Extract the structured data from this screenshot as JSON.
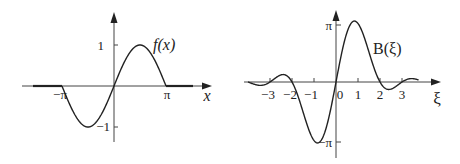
{
  "chart_data": [
    {
      "type": "line",
      "title": "",
      "function_label": "f(x)",
      "xlabel": "x",
      "ylabel": "",
      "x_tick_labels": [
        "−π",
        "π"
      ],
      "x_ticks": [
        -3.14159,
        3.14159
      ],
      "y_tick_labels": [
        "1",
        "−1"
      ],
      "y_ticks": [
        1,
        -1
      ],
      "xlim": [
        -4.6,
        4.6
      ],
      "ylim": [
        -1.35,
        1.8
      ],
      "grid": false,
      "definition": "f(x) = sin(x) for |x| ≤ π, 0 otherwise",
      "series": [
        {
          "name": "f(x)",
          "x": [
            -4.0,
            -3.14159,
            -2.356,
            -1.571,
            -0.785,
            0,
            0.785,
            1.571,
            2.356,
            3.14159,
            4.0
          ],
          "values": [
            0,
            0,
            -0.707,
            -1,
            -0.707,
            0,
            0.707,
            1,
            0.707,
            0,
            0
          ]
        }
      ]
    },
    {
      "type": "line",
      "title": "",
      "function_label": "B(ξ)",
      "xlabel": "ξ",
      "ylabel": "",
      "x_tick_labels": [
        "−3",
        "−2",
        "−1",
        "0",
        "1",
        "2",
        "3"
      ],
      "x_ticks": [
        -3,
        -2,
        -1,
        0,
        1,
        2,
        3
      ],
      "y_tick_labels": [
        "π",
        "−π"
      ],
      "y_ticks": [
        3.14159,
        -3.14159
      ],
      "xlim": [
        -4.2,
        4.6
      ],
      "ylim": [
        -3.6,
        4.0
      ],
      "grid": false,
      "definition": "B(ξ) = 2 sin(πξ) / (1 − ξ²)",
      "series": [
        {
          "name": "B(ξ)",
          "x": [
            -3.8,
            -3,
            -2.5,
            -2,
            -1.5,
            -1,
            -0.5,
            0,
            0.5,
            1,
            1.5,
            2,
            2.5,
            3,
            3.6
          ],
          "values": [
            -0.1,
            0,
            0.381,
            0,
            -1.6,
            -3.14159,
            -2.667,
            0,
            2.667,
            3.14159,
            1.6,
            0,
            -0.381,
            0,
            0.15
          ]
        }
      ]
    }
  ],
  "left_plot": {
    "fn_label": "f(x)",
    "x_label": "x",
    "tick_neg_pi": "−π",
    "tick_pi": "π",
    "tick_one": "1",
    "tick_neg_one": "−1"
  },
  "right_plot": {
    "fn_label": "B(ξ)",
    "x_label": "ξ",
    "tick_pi": "π",
    "tick_neg_pi": "−π",
    "ticks": [
      "−3",
      "−2",
      "−1",
      "0",
      "1",
      "2",
      "3"
    ]
  }
}
